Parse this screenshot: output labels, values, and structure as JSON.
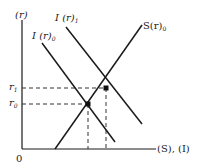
{
  "diagram": {
    "type": "economics-supply-demand",
    "axes": {
      "y_label": "(r)",
      "x_label": "(S), (I)",
      "origin_label": "0"
    },
    "y_ticks": [
      {
        "label": "r",
        "sub": "1"
      },
      {
        "label": "r",
        "sub": "0"
      }
    ],
    "curves": [
      {
        "id": "I0",
        "label": "I (r)",
        "sub": "0"
      },
      {
        "id": "I1",
        "label": "I (r)",
        "sub": "1"
      },
      {
        "id": "S0",
        "label": "S(r)",
        "sub": "0"
      }
    ],
    "equilibria": [
      {
        "curves": [
          "S0",
          "I0"
        ],
        "rate": "r0"
      },
      {
        "curves": [
          "S0",
          "I1"
        ],
        "rate": "r1"
      }
    ],
    "colors": {
      "line": "#1a1a1a",
      "dash": "#333333"
    }
  }
}
